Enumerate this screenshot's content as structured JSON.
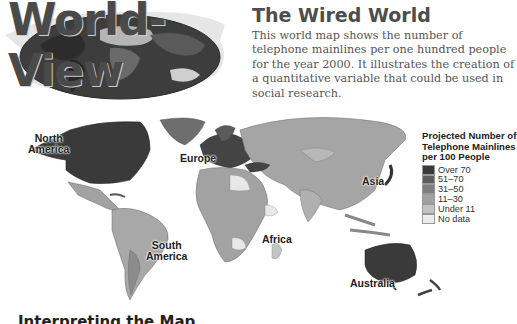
{
  "banner": {
    "title": "World-View"
  },
  "section": {
    "title": "The Wired World",
    "intro": "This world map shows the number of telephone mainlines per one hundred people for the year 2000. It illustrates the creation of a quantitative variable that could be used in social research."
  },
  "map": {
    "regions": [
      {
        "label_line1": "North",
        "label_line2": "America"
      },
      {
        "label_line1": "Europe"
      },
      {
        "label_line1": "Asia"
      },
      {
        "label_line1": "Africa"
      },
      {
        "label_line1": "South",
        "label_line2": "America"
      },
      {
        "label_line1": "Australia"
      }
    ]
  },
  "legend": {
    "title_line1": "Projected Number of",
    "title_line2": "Telephone Mainlines",
    "title_line3": "per 100 People",
    "items": [
      {
        "label": "Over 70",
        "color": "#3a3a3a"
      },
      {
        "label": "51–70",
        "color": "#5e5e5e"
      },
      {
        "label": "31–50",
        "color": "#7f7f7f"
      },
      {
        "label": "11–30",
        "color": "#a2a2a2"
      },
      {
        "label": "Under 11",
        "color": "#c4c4c4"
      },
      {
        "label": "No data",
        "color": "#ececec"
      }
    ]
  },
  "footer": {
    "heading": "Interpreting the Map"
  }
}
